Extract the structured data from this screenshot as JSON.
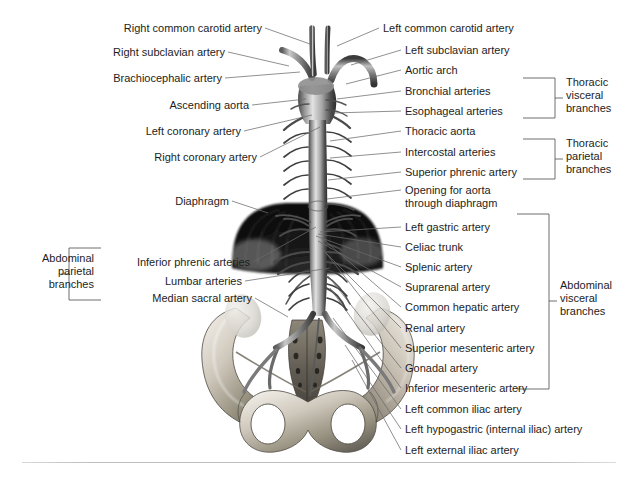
{
  "figure": {
    "type": "anatomical-illustration"
  },
  "labels_left": [
    {
      "id": "right-common-carotid-artery",
      "text": "Right common carotid artery",
      "x_right": 262,
      "y": 22,
      "leader_to_x": 310,
      "leader_to_y": 44
    },
    {
      "id": "right-subclavian-artery",
      "text": "Right subclavian artery",
      "x_right": 225,
      "y": 46,
      "leader_to_x": 289,
      "leader_to_y": 66
    },
    {
      "id": "brachiocephalic-artery",
      "text": "Brachiocephalic artery",
      "x_right": 222,
      "y": 72,
      "leader_to_x": 300,
      "leader_to_y": 72
    },
    {
      "id": "ascending-aorta",
      "text": "Ascending aorta",
      "x_right": 249,
      "y": 99,
      "leader_to_x": 306,
      "leader_to_y": 99
    },
    {
      "id": "left-coronary-artery",
      "text": "Left coronary artery",
      "x_right": 241,
      "y": 125,
      "leader_to_x": 312,
      "leader_to_y": 115
    },
    {
      "id": "right-coronary-artery",
      "text": "Right coronary artery",
      "x_right": 257,
      "y": 151,
      "leader_to_x": 320,
      "leader_to_y": 127
    },
    {
      "id": "diaphragm",
      "text": "Diaphragm",
      "x_right": 229,
      "y": 195,
      "leader_to_x": 268,
      "leader_to_y": 213
    },
    {
      "id": "inferior-phrenic-arteries",
      "text": "Inferior phrenic arteries",
      "x_right": 250,
      "y": 256,
      "leader_to_x": 316,
      "leader_to_y": 227
    },
    {
      "id": "lumbar-arteries",
      "text": "Lumbar arteries",
      "x_right": 242,
      "y": 275,
      "leader_to_x": 330,
      "leader_to_y": 268
    },
    {
      "id": "median-sacral-artery",
      "text": "Median sacral artery",
      "x_right": 252,
      "y": 292,
      "leader_to_x": 288,
      "leader_to_y": 317
    }
  ],
  "labels_right": [
    {
      "id": "left-common-carotid-artery",
      "text": "Left common carotid artery",
      "x_left": 383,
      "y": 22,
      "leader_to_x": 337,
      "leader_to_y": 46
    },
    {
      "id": "left-subclavian-artery",
      "text": "Left subclavian artery",
      "x_left": 405,
      "y": 44,
      "leader_to_x": 351,
      "leader_to_y": 65
    },
    {
      "id": "aortic-arch",
      "text": "Aortic arch",
      "x_left": 405,
      "y": 64,
      "leader_to_x": 346,
      "leader_to_y": 84
    },
    {
      "id": "bronchial-arteries",
      "text": "Bronchial arteries",
      "x_left": 405,
      "y": 85,
      "leader_to_x": 337,
      "leader_to_y": 99
    },
    {
      "id": "esophageal-arteries",
      "text": "Esophageal arteries",
      "x_left": 405,
      "y": 105,
      "leader_to_x": 333,
      "leader_to_y": 113
    },
    {
      "id": "thoracic-aorta",
      "text": "Thoracic aorta",
      "x_left": 405,
      "y": 125,
      "leader_to_x": 330,
      "leader_to_y": 141
    },
    {
      "id": "intercostal-arteries",
      "text": "Intercostal arteries",
      "x_left": 405,
      "y": 146,
      "leader_to_x": 330,
      "leader_to_y": 158
    },
    {
      "id": "superior-phrenic-artery",
      "text": "Superior phrenic artery",
      "x_left": 405,
      "y": 166,
      "leader_to_x": 328,
      "leader_to_y": 180
    },
    {
      "id": "opening-for-aorta-through-diaphragm",
      "text": "Opening for aorta",
      "text2": "through diaphragm",
      "x_left": 405,
      "y": 184,
      "leader_to_x": 327,
      "leader_to_y": 199
    },
    {
      "id": "left-gastric-artery",
      "text": "Left gastric artery",
      "x_left": 405,
      "y": 221,
      "leader_to_x": 320,
      "leader_to_y": 232
    },
    {
      "id": "celiac-trunk",
      "text": "Celiac trunk",
      "x_left": 405,
      "y": 241,
      "leader_to_x": 318,
      "leader_to_y": 234
    },
    {
      "id": "splenic-artery",
      "text": "Splenic artery",
      "x_left": 405,
      "y": 261,
      "leader_to_x": 316,
      "leader_to_y": 236
    },
    {
      "id": "suprarenal-artery",
      "text": "Suprarenal artery",
      "x_left": 405,
      "y": 281,
      "leader_to_x": 318,
      "leader_to_y": 241
    },
    {
      "id": "common-hepatic-artery",
      "text": "Common hepatic artery",
      "x_left": 405,
      "y": 301,
      "leader_to_x": 322,
      "leader_to_y": 238
    },
    {
      "id": "renal-artery",
      "text": "Renal artery",
      "x_left": 405,
      "y": 322,
      "leader_to_x": 326,
      "leader_to_y": 253
    },
    {
      "id": "superior-mesenteric-artery",
      "text": "Superior mesenteric artery",
      "x_left": 405,
      "y": 342,
      "leader_to_x": 322,
      "leader_to_y": 248
    },
    {
      "id": "gonadal-artery",
      "text": "Gonadal artery",
      "x_left": 405,
      "y": 362,
      "leader_to_x": 328,
      "leader_to_y": 276
    },
    {
      "id": "inferior-mesenteric-artery",
      "text": "Inferior mesenteric artery",
      "x_left": 405,
      "y": 382,
      "leader_to_x": 330,
      "leader_to_y": 288
    },
    {
      "id": "left-common-iliac-artery",
      "text": "Left common iliac artery",
      "x_left": 405,
      "y": 403,
      "leader_to_x": 333,
      "leader_to_y": 318
    },
    {
      "id": "left-hypogastric-internal-iliac-artery",
      "text": "Left hypogastric (internal iliac) artery",
      "x_left": 405,
      "y": 423,
      "leader_to_x": 345,
      "leader_to_y": 345
    },
    {
      "id": "left-external-iliac-artery",
      "text": "Left external iliac artery",
      "x_left": 405,
      "y": 444,
      "leader_to_x": 352,
      "leader_to_y": 360
    }
  ],
  "groups": [
    {
      "id": "thoracic-visceral-branches",
      "line1": "Thoracic",
      "line2": "visceral",
      "line3": "branches",
      "bracket": {
        "x1": 523,
        "x2": 555,
        "y1": 78,
        "y2": 118,
        "tick_y": 98,
        "tick_x2": 563,
        "side": "right"
      },
      "text_x": 566,
      "text_y": 76
    },
    {
      "id": "thoracic-parietal-branches",
      "line1": "Thoracic",
      "line2": "parietal",
      "line3": "branches",
      "bracket": {
        "x1": 523,
        "x2": 555,
        "y1": 139,
        "y2": 179,
        "tick_y": 159,
        "tick_x2": 563,
        "side": "right"
      },
      "text_x": 566,
      "text_y": 137
    },
    {
      "id": "abdominal-visceral-branches",
      "line1": "Abdominal",
      "line2": "visceral",
      "line3": "branches",
      "bracket": {
        "x1": 517,
        "x2": 549,
        "y1": 214,
        "y2": 389,
        "tick_y": 301,
        "tick_x2": 557,
        "side": "right"
      },
      "text_x": 560,
      "text_y": 279
    },
    {
      "id": "abdominal-parietal-branches",
      "line1": "Abdominal",
      "line2": "parietal",
      "line3": "branches",
      "bracket": {
        "x1": 101,
        "x2": 69,
        "y1": 248,
        "y2": 300,
        "tick_y": 274,
        "tick_x2": 61,
        "side": "left"
      },
      "text_x": 18,
      "text_y": 252
    }
  ],
  "colors": {
    "ink": "#1d1d1d",
    "leader": "#6b6b6b",
    "bracket": "#5d5d5d",
    "rule": "#c4c4c4",
    "vessel_dark": "#2e2e2e",
    "vessel_mid": "#8a8a8a",
    "vessel_light": "#d8d8d8",
    "bone_light": "#e6e2da",
    "bone_mid": "#b4ada1",
    "bone_dark": "#6e6a61",
    "diaphragm_dark": "#121212",
    "background": "#ffffff"
  }
}
